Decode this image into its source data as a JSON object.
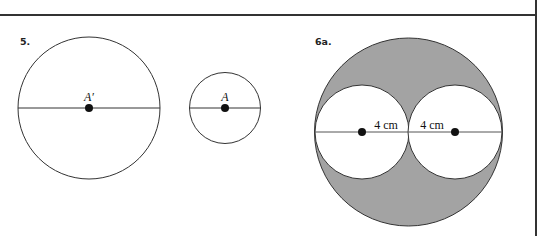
{
  "problems": [
    {
      "label": "5.",
      "figures": [
        {
          "type": "circle-with-diameter",
          "center_label": "A′",
          "cx": 89,
          "cy": 108,
          "r": 71
        },
        {
          "type": "circle-with-diameter",
          "center_label": "A",
          "cx": 225,
          "cy": 108,
          "r": 35.5
        }
      ]
    },
    {
      "label": "6a.",
      "figure": {
        "type": "shaded-circle-with-two-inner-circles",
        "outer": {
          "cx": 408.5,
          "cy": 132,
          "r": 94
        },
        "inner_left": {
          "cx": 362,
          "cy": 132,
          "r": 47
        },
        "inner_right": {
          "cx": 455,
          "cy": 132,
          "r": 47
        },
        "radius_labels": [
          "4 cm",
          "4 cm"
        ],
        "shade_color": "#a3a3a3"
      }
    }
  ]
}
